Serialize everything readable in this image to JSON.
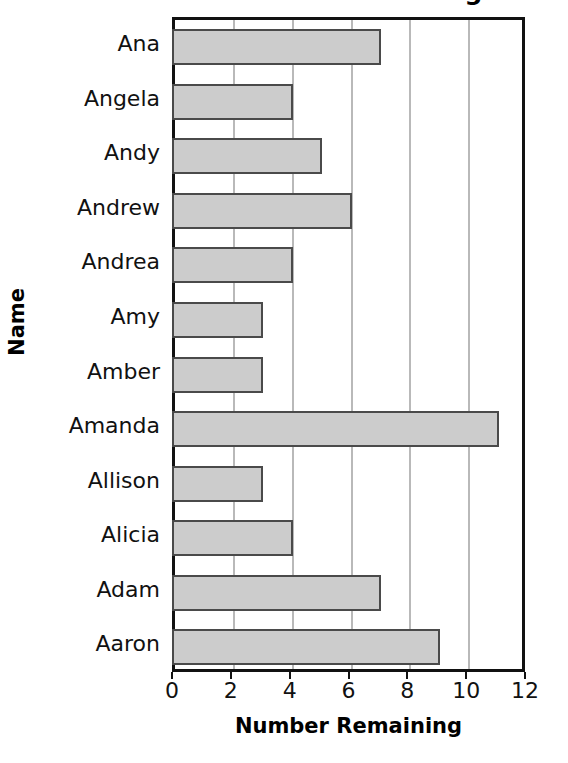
{
  "chart_data": {
    "type": "bar",
    "orientation": "horizontal",
    "title": "Number Remaining",
    "xlabel": "Number Remaining",
    "ylabel": "Name",
    "categories": [
      "Ana",
      "Angela",
      "Andy",
      "Andrew",
      "Andrea",
      "Amy",
      "Amber",
      "Amanda",
      "Allison",
      "Alicia",
      "Adam",
      "Aaron"
    ],
    "values": [
      7,
      4,
      5,
      6,
      4,
      3,
      3,
      11,
      3,
      4,
      7,
      9
    ],
    "xlim": [
      0,
      12
    ],
    "xticks": [
      0,
      2,
      4,
      6,
      8,
      10,
      12
    ],
    "xtick_labels": [
      "0",
      "2",
      "4",
      "6",
      "8",
      "10",
      "12"
    ],
    "grid": "vertical",
    "legend": "none",
    "bar_fill_color": "#cccccc",
    "bar_edge_color": "#4a4a4a",
    "axis_color": "#111111",
    "gridline_color": "#b9b9b9",
    "title_clipped": true
  },
  "axis": {
    "y_title": "Name",
    "x_title": "Number Remaining"
  }
}
